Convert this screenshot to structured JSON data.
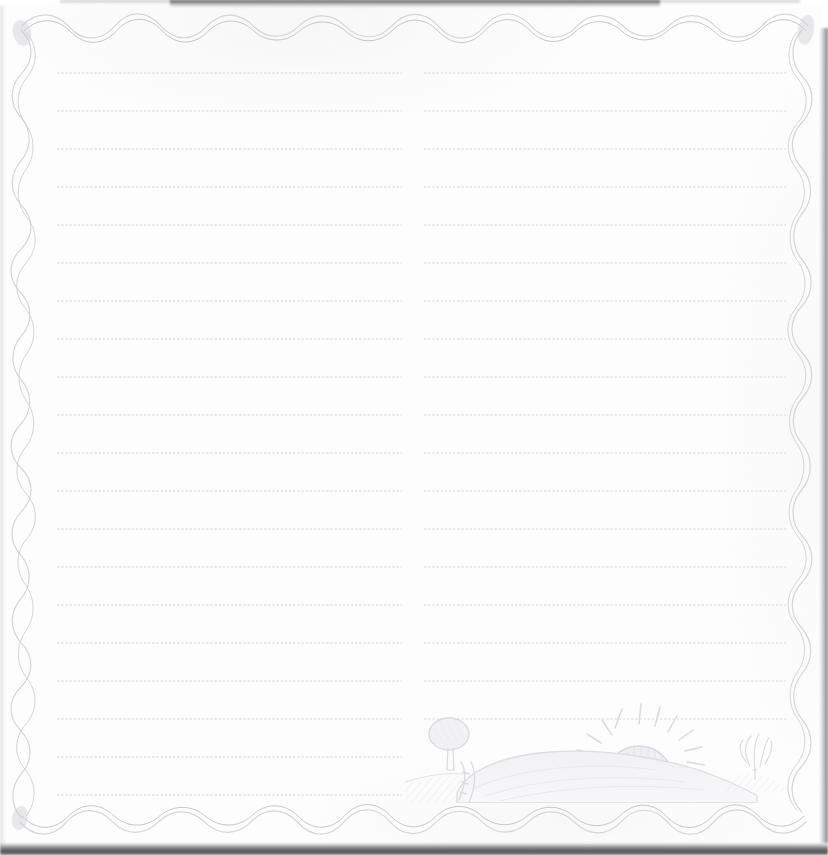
{
  "document": {
    "kind": "stationery-notepaper",
    "title": "Blank Lined Writing Paper",
    "paper_color": "#fdfdfd",
    "background_color": "#ffffff",
    "width": 828,
    "height": 855,
    "text_content": ""
  },
  "border": {
    "style": "scalloped-wavy",
    "color": "#d8d8dc",
    "stroke_width": 1.1,
    "top_amplitude": 11,
    "top_period": 46,
    "side_amplitude": 9,
    "side_period": 45,
    "bottom_amplitude": 11,
    "bottom_period": 47
  },
  "rules": {
    "style": "dotted",
    "color": "#e8e8ec",
    "dot_spacing": 4.15,
    "line_spacing": 38,
    "first_line_y": 72,
    "columns": [
      {
        "name": "left-column",
        "x": 57,
        "width": 345,
        "line_count": 20
      },
      {
        "name": "right-column",
        "x": 424,
        "width": 362,
        "line_count": 18
      }
    ]
  },
  "illustration": {
    "name": "sunrise-landscape-sketch",
    "medium": "pencil-sketch",
    "line_color": "#dcdce0",
    "fill_color": "#f2f2f5",
    "elements": [
      {
        "name": "sun",
        "label": "rising sun with face",
        "ray_count": 11
      },
      {
        "name": "hill",
        "label": "rolling hill"
      },
      {
        "name": "tree-left",
        "label": "small tree"
      },
      {
        "name": "tree-right",
        "label": "small shrub tree"
      },
      {
        "name": "ground-hatching",
        "label": "diagonal hatched field"
      },
      {
        "name": "path",
        "label": "winding path"
      }
    ]
  }
}
